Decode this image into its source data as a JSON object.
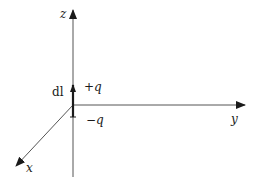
{
  "diagram": {
    "axes": {
      "z": {
        "label": "z"
      },
      "y": {
        "label": "y"
      },
      "x": {
        "label": "x"
      }
    },
    "dipole": {
      "length_label": "dl",
      "positive_charge": "+q",
      "negative_charge": "−q"
    }
  }
}
